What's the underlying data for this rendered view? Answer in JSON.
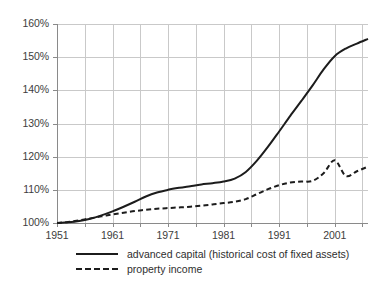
{
  "chart_data": {
    "type": "line",
    "title": "",
    "xlabel": "",
    "ylabel": "",
    "xlim": [
      1951,
      2007
    ],
    "ylim": [
      100,
      160
    ],
    "grid": true,
    "grid_x_step": 5,
    "grid_y_step": 10,
    "legend_position": "bottom-left",
    "y_ticks": [
      "100%",
      "110%",
      "120%",
      "130%",
      "140%",
      "150%",
      "160%"
    ],
    "y_tick_values": [
      100,
      110,
      120,
      130,
      140,
      150,
      160
    ],
    "x_ticks": [
      "1951",
      "1961",
      "1971",
      "1981",
      "1991",
      "2001"
    ],
    "x_tick_values": [
      1951,
      1961,
      1971,
      1981,
      1991,
      2001
    ],
    "x": [
      1951,
      1953,
      1955,
      1957,
      1959,
      1961,
      1963,
      1965,
      1967,
      1969,
      1971,
      1973,
      1975,
      1977,
      1979,
      1981,
      1983,
      1985,
      1987,
      1989,
      1991,
      1993,
      1995,
      1997,
      1999,
      2001,
      2003,
      2005,
      2007
    ],
    "series": [
      {
        "name": "advanced capital (historical cost of fixed assets)",
        "style": "solid",
        "color": "#1c1c1c",
        "values": [
          100.0,
          100.2,
          100.6,
          101.3,
          102.3,
          103.5,
          104.9,
          106.4,
          108.0,
          109.2,
          110.0,
          110.6,
          111.1,
          111.6,
          112.0,
          112.5,
          113.4,
          115.4,
          118.8,
          123.0,
          127.6,
          132.3,
          136.8,
          141.4,
          146.3,
          150.3,
          152.6,
          154.1,
          155.5
        ]
      },
      {
        "name": "property income",
        "style": "dashed",
        "color": "#1c1c1c",
        "values": [
          100.0,
          100.3,
          100.8,
          101.4,
          102.0,
          102.6,
          103.1,
          103.6,
          104.0,
          104.3,
          104.5,
          104.7,
          104.9,
          105.2,
          105.6,
          106.0,
          106.4,
          107.2,
          108.7,
          110.2,
          111.4,
          112.2,
          112.5,
          112.7,
          115.0,
          118.9,
          114.2,
          115.6,
          117.0
        ]
      }
    ]
  },
  "legend": {
    "items": [
      {
        "label": "advanced capital (historical cost of fixed assets)",
        "style": "solid"
      },
      {
        "label": "property income",
        "style": "dashed"
      }
    ]
  }
}
